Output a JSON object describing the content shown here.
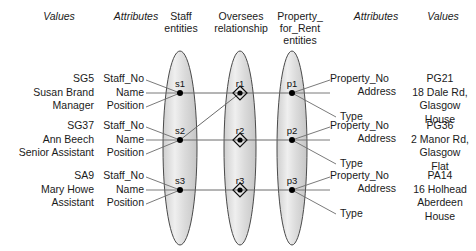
{
  "diagram": {
    "headers": [
      {
        "id": "values-left",
        "label": "Values",
        "italic": true,
        "x": 24,
        "y": 10,
        "w": 70
      },
      {
        "id": "attributes-left",
        "label": "Attributes",
        "italic": true,
        "x": 100,
        "y": 10,
        "w": 72
      },
      {
        "id": "staff-entities",
        "label": "Staff\nentities",
        "italic": false,
        "x": 156,
        "y": 10,
        "w": 50
      },
      {
        "id": "oversees-rel",
        "label": "Oversees\nrelationship",
        "italic": false,
        "x": 205,
        "y": 10,
        "w": 72
      },
      {
        "id": "property-ent",
        "label": "Property_\nfor_Rent\nentities",
        "italic": false,
        "x": 272,
        "y": 10,
        "w": 56
      },
      {
        "id": "attributes-right",
        "label": "Attributes",
        "italic": true,
        "x": 340,
        "y": 10,
        "w": 72
      },
      {
        "id": "values-right",
        "label": "Values",
        "italic": true,
        "x": 415,
        "y": 10,
        "w": 56
      }
    ],
    "left_values": [
      {
        "id": "staff-1-values",
        "text": "SG5\nSusan Brand\nManager",
        "y": 78
      },
      {
        "id": "staff-2-values",
        "text": "SG37\nAnn Beech\nSenior Assistant",
        "y": 125
      },
      {
        "id": "staff-3-values",
        "text": "SA9\nMary Howe\nAssistant",
        "y": 175
      }
    ],
    "left_attributes": [
      {
        "id": "staff-1-attrs",
        "text": "Staff_No\nName\nPosition",
        "y": 78
      },
      {
        "id": "staff-2-attrs",
        "text": "Staff_No\nName\nPosition",
        "y": 125
      },
      {
        "id": "staff-3-attrs",
        "text": "Staff_No\nName\nPosition",
        "y": 175
      }
    ],
    "right_attributes": [
      {
        "id": "prop-1-attrs",
        "lines": [
          "Property_No",
          "Address",
          "Type"
        ],
        "y": 78
      },
      {
        "id": "prop-2-attrs",
        "lines": [
          "Property_No",
          "Address",
          "Type"
        ],
        "y": 125
      },
      {
        "id": "prop-3-attrs",
        "lines": [
          "Property_No",
          "Address",
          "Type"
        ],
        "y": 175
      }
    ],
    "right_values": [
      {
        "id": "prop-1-values",
        "text": "PG21\n18 Dale Rd,\nGlasgow\nHouse",
        "y": 78
      },
      {
        "id": "prop-2-values",
        "text": "PG36\n2 Manor Rd,\nGlasgow\nFlat",
        "y": 125
      },
      {
        "id": "prop-3-values",
        "text": "PA14\n16 Holhead\nAberdeen\nHouse",
        "y": 175
      }
    ],
    "staff_nodes": [
      {
        "id": "s1",
        "label": "s1",
        "cx": 180,
        "cy": 93
      },
      {
        "id": "s2",
        "label": "s2",
        "cx": 180,
        "cy": 140
      },
      {
        "id": "s3",
        "label": "s3",
        "cx": 180,
        "cy": 190
      }
    ],
    "relationship_nodes": [
      {
        "id": "r1",
        "label": "r1",
        "cx": 240,
        "cy": 93
      },
      {
        "id": "r2",
        "label": "r2",
        "cx": 240,
        "cy": 140
      },
      {
        "id": "r3",
        "label": "r3",
        "cx": 240,
        "cy": 190
      }
    ],
    "property_nodes": [
      {
        "id": "p1",
        "label": "p1",
        "cx": 292,
        "cy": 93
      },
      {
        "id": "p2",
        "label": "p2",
        "cx": 292,
        "cy": 140
      },
      {
        "id": "p3",
        "label": "p3",
        "cx": 292,
        "cy": 190
      }
    ],
    "ellipses": [
      {
        "id": "staff-ellipse",
        "cx": 180,
        "cy": 148,
        "rx": 17,
        "ry": 97
      },
      {
        "id": "oversees-ellipse",
        "cx": 240,
        "cy": 148,
        "rx": 16,
        "ry": 97
      },
      {
        "id": "property-ellipse",
        "cx": 292,
        "cy": 148,
        "rx": 15,
        "ry": 97
      }
    ],
    "colors": {
      "ellipse_fill": "#d9d9d9",
      "ellipse_highlight": "#f0f0f0",
      "ellipse_stroke": "#4a4a4a",
      "line": "#6b6b6b",
      "node": "#000000",
      "text": "#1a1a1a"
    }
  }
}
